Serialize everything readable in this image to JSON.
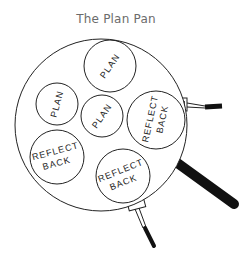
{
  "title": "The Plan Pan",
  "pan": {
    "circles": [
      {
        "id": "plan-top",
        "lines": [
          "PLAN"
        ],
        "cx": 110,
        "cy": 66,
        "r": 26,
        "rotate": -55
      },
      {
        "id": "plan-left",
        "lines": [
          "PLAN"
        ],
        "cx": 57,
        "cy": 104,
        "r": 21,
        "rotate": -75
      },
      {
        "id": "plan-middle",
        "lines": [
          "PLAN"
        ],
        "cx": 102,
        "cy": 116,
        "r": 21,
        "rotate": -55
      },
      {
        "id": "reflect-back-right",
        "lines": [
          "REFLECT",
          "BACK"
        ],
        "cx": 156,
        "cy": 120,
        "r": 29,
        "rotate": -80
      },
      {
        "id": "reflect-back-left",
        "lines": [
          "REFLECT",
          "BACK"
        ],
        "cx": 57,
        "cy": 157,
        "r": 27,
        "rotate": -15
      },
      {
        "id": "reflect-back-bottom",
        "lines": [
          "REFLECT",
          "BACK"
        ],
        "cx": 123,
        "cy": 176,
        "r": 27,
        "rotate": -20
      }
    ]
  },
  "labels": {
    "c0_l0": "PLAN",
    "c1_l0": "PLAN",
    "c2_l0": "PLAN",
    "c3_l0": "REFLECT",
    "c3_l1": "BACK",
    "c4_l0": "REFLECT",
    "c4_l1": "BACK",
    "c5_l0": "REFLECT",
    "c5_l1": "BACK"
  }
}
